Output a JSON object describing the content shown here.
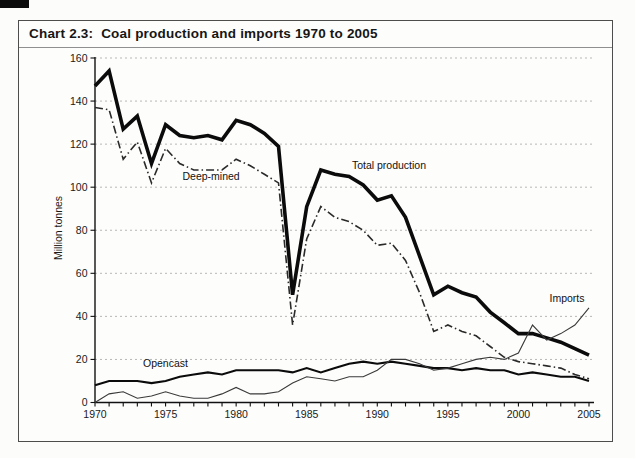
{
  "page": {
    "background_color": "#fdfdfc",
    "frame_border_color": "#4d4d4d",
    "scan_artifact": "black mark top-left corner"
  },
  "chart_data": {
    "type": "line",
    "title": "Chart 2.3:  Coal production and imports 1970 to 2005",
    "ylabel": "Million tonnes",
    "xlabel": "",
    "xlim": [
      1970,
      2005
    ],
    "ylim": [
      0,
      160
    ],
    "x_ticks": [
      1970,
      1975,
      1980,
      1985,
      1990,
      1995,
      2000,
      2005
    ],
    "x_minor_tick_every": 1,
    "y_ticks": [
      0,
      20,
      40,
      60,
      80,
      100,
      120,
      140,
      160
    ],
    "grid": "horizontal dotted gray",
    "legend": "inline text labels next to lines",
    "x": [
      1970,
      1971,
      1972,
      1973,
      1974,
      1975,
      1976,
      1977,
      1978,
      1979,
      1980,
      1981,
      1982,
      1983,
      1984,
      1985,
      1986,
      1987,
      1988,
      1989,
      1990,
      1991,
      1992,
      1993,
      1994,
      1995,
      1996,
      1997,
      1998,
      1999,
      2000,
      2001,
      2002,
      2003,
      2004,
      2005
    ],
    "series": [
      {
        "name": "Total production",
        "style": "solid",
        "line_width": "thick",
        "color": "#0b0b0b",
        "values": [
          147,
          154,
          127,
          133,
          111,
          129,
          124,
          123,
          124,
          122,
          131,
          129,
          125,
          119,
          50,
          91,
          108,
          106,
          105,
          101,
          94,
          96,
          86,
          68,
          50,
          54,
          51,
          49,
          42,
          37,
          32,
          32,
          30,
          28,
          25,
          22
        ]
      },
      {
        "name": "Deep-mined",
        "style": "dash-dot",
        "line_width": "medium",
        "color": "#2a2a2a",
        "values": [
          137,
          136,
          113,
          121,
          102,
          118,
          111,
          108,
          108,
          108,
          113,
          110,
          106,
          102,
          36,
          76,
          91,
          86,
          84,
          80,
          73,
          74,
          66,
          51,
          33,
          36,
          33,
          31,
          26,
          21,
          19,
          18,
          17,
          16,
          13,
          11
        ]
      },
      {
        "name": "Opencast",
        "style": "solid",
        "line_width": "medium",
        "color": "#0b0b0b",
        "values": [
          8,
          10,
          10,
          10,
          9,
          10,
          12,
          13,
          14,
          13,
          15,
          15,
          15,
          15,
          14,
          16,
          14,
          16,
          18,
          19,
          18,
          19,
          18,
          17,
          16,
          16,
          15,
          16,
          15,
          15,
          13,
          14,
          13,
          12,
          12,
          10
        ]
      },
      {
        "name": "Imports",
        "style": "solid",
        "line_width": "thin",
        "color": "#3a3a3a",
        "values": [
          0,
          4,
          5,
          2,
          3,
          5,
          3,
          2,
          2,
          4,
          7,
          4,
          4,
          5,
          9,
          12,
          11,
          10,
          12,
          12,
          15,
          20,
          20,
          18,
          15,
          16,
          18,
          20,
          21,
          20,
          23,
          36,
          29,
          32,
          36,
          44
        ]
      }
    ],
    "annotations": [
      {
        "text": "Deep-mined",
        "x": 1976.2,
        "y": 103.3,
        "anchor": "start"
      },
      {
        "text": "Total production",
        "x": 1988.2,
        "y": 108.5,
        "anchor": "start"
      },
      {
        "text": "Opencast",
        "x": 1973.4,
        "y": 16.5,
        "anchor": "start"
      },
      {
        "text": "Imports",
        "x": 2002.2,
        "y": 46.7,
        "anchor": "start"
      }
    ]
  }
}
